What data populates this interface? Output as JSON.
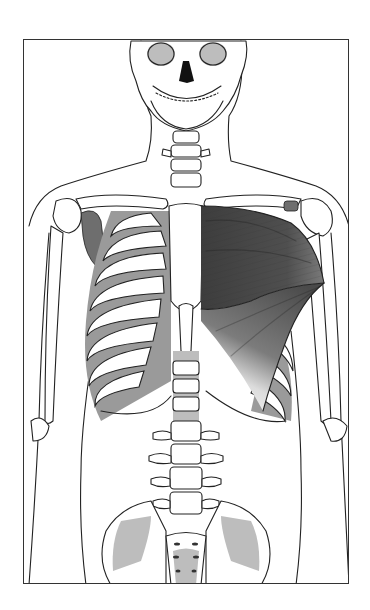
{
  "figure": {
    "highlighted_muscle": "pectoralis major (left side of figure)",
    "colors": {
      "frame": "#333333",
      "outline": "#222222",
      "muscle_dark": "#4a4a4a",
      "muscle_mid": "#8a8a8a",
      "muscle_light": "#d8d8d8",
      "bone_shade": "#bdbdbd",
      "background": "#ffffff"
    },
    "frame": {
      "left": 23,
      "top": 39,
      "right": 349,
      "bottom": 584
    }
  }
}
